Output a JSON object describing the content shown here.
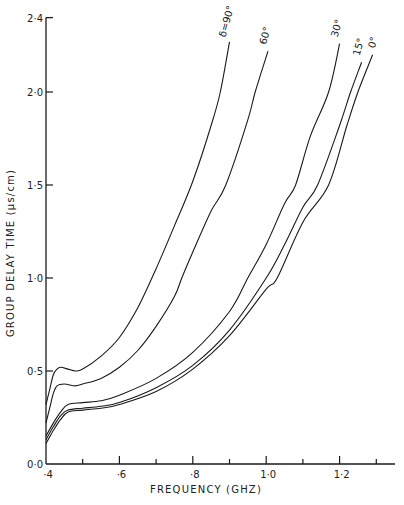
{
  "chart_data": {
    "type": "line",
    "title": "",
    "xlabel": "FREQUENCY (GHz)",
    "ylabel": "GROUP DELAY TIME (μs/cm)",
    "xlim": [
      0.4,
      1.34
    ],
    "ylim": [
      0.0,
      2.4
    ],
    "grid": false,
    "legend_position": "inline labels at curve ends",
    "x_ticks": [
      {
        "value": 0.4,
        "label": "·4",
        "major": true
      },
      {
        "value": 0.5,
        "label": "",
        "major": false
      },
      {
        "value": 0.6,
        "label": "·6",
        "major": true
      },
      {
        "value": 0.7,
        "label": "",
        "major": false
      },
      {
        "value": 0.8,
        "label": "·8",
        "major": true
      },
      {
        "value": 0.9,
        "label": "",
        "major": false
      },
      {
        "value": 1.0,
        "label": "1·0",
        "major": true
      },
      {
        "value": 1.1,
        "label": "",
        "major": false
      },
      {
        "value": 1.2,
        "label": "1·2",
        "major": true
      },
      {
        "value": 1.3,
        "label": "",
        "major": false
      }
    ],
    "y_ticks": [
      {
        "value": 0.0,
        "label": "0·0"
      },
      {
        "value": 0.5,
        "label": "0·5"
      },
      {
        "value": 1.0,
        "label": "1·0"
      },
      {
        "value": 1.5,
        "label": "1·5"
      },
      {
        "value": 2.0,
        "label": "2·0"
      },
      {
        "value": 2.4,
        "label": "2·4"
      }
    ],
    "series": [
      {
        "name": "δ = 90°",
        "label": "δ=90°",
        "points": [
          [
            0.4,
            0.32
          ],
          [
            0.41,
            0.4
          ],
          [
            0.42,
            0.48
          ],
          [
            0.43,
            0.51
          ],
          [
            0.44,
            0.52
          ],
          [
            0.46,
            0.51
          ],
          [
            0.48,
            0.5
          ],
          [
            0.5,
            0.51
          ],
          [
            0.55,
            0.58
          ],
          [
            0.6,
            0.68
          ],
          [
            0.65,
            0.84
          ],
          [
            0.7,
            1.05
          ],
          [
            0.75,
            1.28
          ],
          [
            0.8,
            1.52
          ],
          [
            0.85,
            1.82
          ],
          [
            0.875,
            2.0
          ],
          [
            0.9,
            2.27
          ]
        ]
      },
      {
        "name": "δ = 60°",
        "label": "60°",
        "points": [
          [
            0.4,
            0.22
          ],
          [
            0.41,
            0.3
          ],
          [
            0.42,
            0.38
          ],
          [
            0.43,
            0.42
          ],
          [
            0.45,
            0.43
          ],
          [
            0.48,
            0.42
          ],
          [
            0.5,
            0.43
          ],
          [
            0.55,
            0.46
          ],
          [
            0.6,
            0.52
          ],
          [
            0.65,
            0.61
          ],
          [
            0.7,
            0.74
          ],
          [
            0.75,
            0.9
          ],
          [
            0.77,
            1.0
          ],
          [
            0.8,
            1.14
          ],
          [
            0.85,
            1.36
          ],
          [
            0.89,
            1.5
          ],
          [
            0.95,
            1.85
          ],
          [
            0.97,
            2.0
          ],
          [
            1.005,
            2.22
          ]
        ]
      },
      {
        "name": "δ = 30°",
        "label": "30°",
        "points": [
          [
            0.4,
            0.15
          ],
          [
            0.42,
            0.22
          ],
          [
            0.44,
            0.28
          ],
          [
            0.46,
            0.32
          ],
          [
            0.5,
            0.33
          ],
          [
            0.55,
            0.34
          ],
          [
            0.6,
            0.37
          ],
          [
            0.7,
            0.46
          ],
          [
            0.8,
            0.6
          ],
          [
            0.9,
            0.82
          ],
          [
            0.95,
            1.0
          ],
          [
            1.0,
            1.18
          ],
          [
            1.05,
            1.4
          ],
          [
            1.08,
            1.5
          ],
          [
            1.12,
            1.76
          ],
          [
            1.17,
            2.0
          ],
          [
            1.2,
            2.26
          ]
        ]
      },
      {
        "name": "δ = 15°",
        "label": "15°",
        "points": [
          [
            0.4,
            0.13
          ],
          [
            0.42,
            0.2
          ],
          [
            0.44,
            0.26
          ],
          [
            0.46,
            0.29
          ],
          [
            0.5,
            0.3
          ],
          [
            0.55,
            0.31
          ],
          [
            0.6,
            0.33
          ],
          [
            0.7,
            0.41
          ],
          [
            0.8,
            0.53
          ],
          [
            0.9,
            0.72
          ],
          [
            1.0,
            1.0
          ],
          [
            1.05,
            1.18
          ],
          [
            1.1,
            1.38
          ],
          [
            1.14,
            1.5
          ],
          [
            1.2,
            1.82
          ],
          [
            1.23,
            2.0
          ],
          [
            1.26,
            2.16
          ]
        ]
      },
      {
        "name": "δ = 0°",
        "label": "0°",
        "points": [
          [
            0.4,
            0.11
          ],
          [
            0.42,
            0.18
          ],
          [
            0.44,
            0.24
          ],
          [
            0.46,
            0.28
          ],
          [
            0.5,
            0.29
          ],
          [
            0.55,
            0.3
          ],
          [
            0.6,
            0.32
          ],
          [
            0.7,
            0.39
          ],
          [
            0.8,
            0.51
          ],
          [
            0.9,
            0.69
          ],
          [
            1.0,
            0.94
          ],
          [
            1.03,
            1.0
          ],
          [
            1.1,
            1.3
          ],
          [
            1.17,
            1.5
          ],
          [
            1.22,
            1.82
          ],
          [
            1.25,
            2.0
          ],
          [
            1.29,
            2.2
          ]
        ]
      }
    ]
  },
  "plot": {
    "x_axis_title": "FREQUENCY (GHZ)",
    "y_axis_title": "GROUP DELAY TIME (μs/cm)",
    "line_color": "#1a1a1a",
    "background": "#ffffff"
  }
}
